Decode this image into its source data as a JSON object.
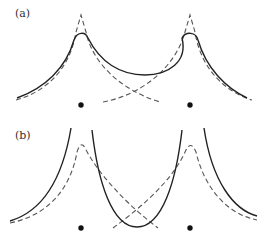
{
  "figure": {
    "panels": [
      {
        "id": "a",
        "label": "(a)",
        "description": "Two-center potential: solid total curve with local maxima above each center and a shallow minimum between; dashed individual single-center curves peaking sharply above each dot",
        "centers": [
          {
            "x": 81,
            "y": 105
          },
          {
            "x": 190,
            "y": 105
          }
        ]
      },
      {
        "id": "b",
        "label": "(b)",
        "description": "Solid curves diverging near each center with a deep U-shaped well between them; dashed single-center curves peaking above each dot and crossing below",
        "centers": [
          {
            "x": 81,
            "y": 106
          },
          {
            "x": 190,
            "y": 106
          }
        ]
      }
    ],
    "colors": {
      "solid_line": "#222222",
      "dashed_line": "#555555",
      "dot": "#111111",
      "background": "#ffffff"
    }
  }
}
